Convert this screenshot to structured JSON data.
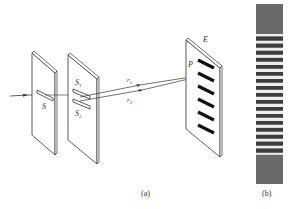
{
  "figure": {
    "panel_a": {
      "caption": "(a)",
      "labels": {
        "single_slit": "S",
        "slit_1": "S",
        "slit_1_sub": "1",
        "slit_2": "S",
        "slit_2_sub": "2",
        "path_1": "r",
        "path_1_sub": "1",
        "path_2": "r",
        "path_2_sub": "2",
        "point": "P",
        "screen": "E"
      },
      "bright_fringes_on_screen": 6
    },
    "panel_b": {
      "caption": "(b)",
      "fringe_pattern": "alternating bright and dark bands",
      "visible_band_count": 18
    },
    "colors": {
      "line": "#333333",
      "fringe_dark": "#555555",
      "fringe_light": "#e8e8e8",
      "background": "#ffffff"
    }
  }
}
